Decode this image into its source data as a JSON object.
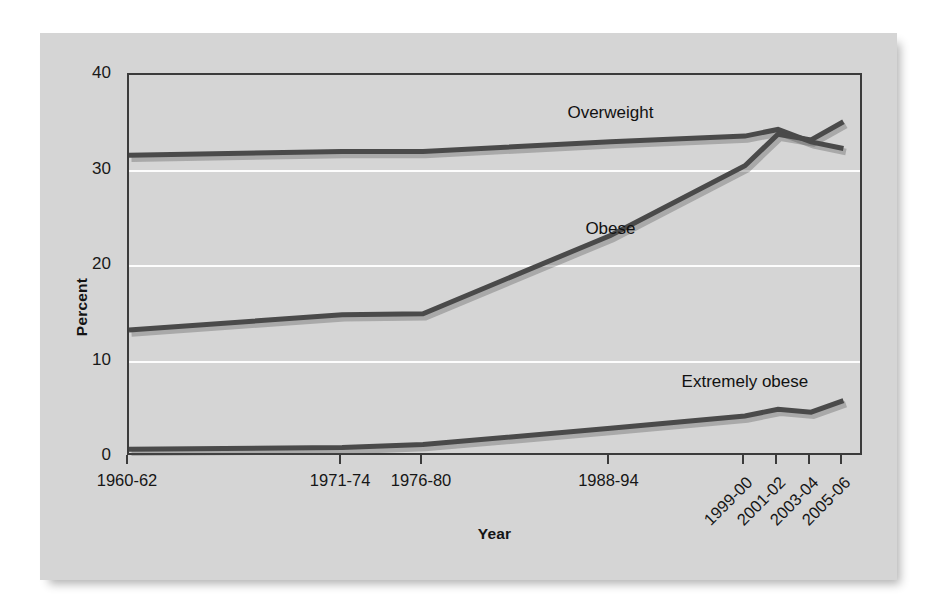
{
  "chart_data": {
    "type": "line",
    "title": "",
    "subtitle": "",
    "xlabel": "Year",
    "ylabel": "Percent",
    "ylim": [
      0,
      40
    ],
    "yticks": [
      0,
      10,
      20,
      30,
      40
    ],
    "grid": "horizontal-white-gridlines-at-10-20-30",
    "legend_position": "inline-labels-on-plot",
    "categories": [
      "1960-62",
      "1971-74",
      "1976-80",
      "1988-94",
      "1999-00",
      "2001-02",
      "2003-04",
      "2005-06"
    ],
    "tick_label_rotation": {
      "1960-62": 0,
      "1971-74": 0,
      "1976-80": 0,
      "1988-94": 0,
      "1999-00": -45,
      "2001-02": -45,
      "2003-04": -45,
      "2005-06": -45
    },
    "series": [
      {
        "name": "Overweight",
        "values": [
          31.6,
          32.0,
          32.0,
          33.0,
          33.6,
          34.3,
          33.0,
          32.3
        ],
        "label_x_category": "1988-94",
        "label_value": 36.0
      },
      {
        "name": "Obese",
        "values": [
          13.3,
          14.9,
          15.0,
          23.2,
          30.5,
          33.8,
          33.2,
          35.1
        ],
        "label_x_category": "1988-94",
        "label_value": 23.9
      },
      {
        "name": "Extremely obese",
        "values": [
          0.8,
          1.0,
          1.3,
          3.0,
          4.3,
          5.0,
          4.7,
          5.9
        ],
        "label_x_category": "1999-00",
        "label_value": 7.9
      }
    ],
    "colors": {
      "series_line": "#4a4a4a",
      "panel_background": "#d5d5d5",
      "gridline": "#fdfdfd",
      "axis": "#3b3b3b",
      "text": "#141414"
    }
  },
  "axis": {
    "y_tick_labels": [
      "40",
      "30",
      "20",
      "10",
      "0"
    ],
    "y_title": "Percent",
    "x_title": "Year",
    "x_tick_labels": [
      "1960-62",
      "1971-74",
      "1976-80",
      "1988-94",
      "1999-00",
      "2001-02",
      "2003-04",
      "2005-06"
    ]
  },
  "annotations": {
    "overweight_label": "Overweight",
    "obese_label": "Obese",
    "extremely_obese_label": "Extremely obese"
  }
}
